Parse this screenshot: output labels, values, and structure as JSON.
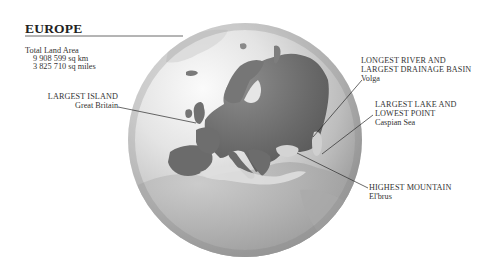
{
  "title": "EUROPE",
  "total_land_area": {
    "label": "Total Land Area",
    "values": [
      "9 908 599 sq km",
      "3 825 710 sq miles"
    ]
  },
  "callouts": [
    {
      "id": "largest-island",
      "heading": "LARGEST ISLAND",
      "value": "Great Britain"
    },
    {
      "id": "longest-river",
      "heading_lines": [
        "LONGEST RIVER AND",
        "LARGEST DRAINAGE BASIN"
      ],
      "value": "Volga"
    },
    {
      "id": "largest-lake",
      "heading_lines": [
        "LARGEST LAKE AND",
        "LOWEST POINT"
      ],
      "value": "Caspian Sea"
    },
    {
      "id": "highest-mountain",
      "heading": "HIGHEST MOUNTAIN",
      "value": "El'brus"
    }
  ],
  "colors": {
    "background": "#ffffff",
    "globe_light": "#f2f2f2",
    "globe_dark": "#8f8f8f",
    "land": "#6f6f6f",
    "leader_line": "#2a2a2a",
    "text": "#2a2a2a"
  }
}
